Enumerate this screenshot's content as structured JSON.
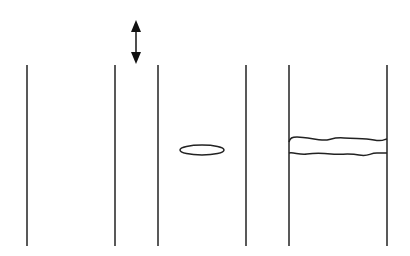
{
  "diagram": {
    "stroke_color": "#222222",
    "background": "#ffffff",
    "lines": [
      {
        "id": "line-1",
        "x": 27,
        "y1": 65,
        "y2": 246
      },
      {
        "id": "line-2",
        "x": 115,
        "y1": 65,
        "y2": 246
      },
      {
        "id": "line-3",
        "x": 158,
        "y1": 65,
        "y2": 246
      },
      {
        "id": "line-4",
        "x": 246,
        "y1": 65,
        "y2": 246
      },
      {
        "id": "line-5",
        "x": 289,
        "y1": 65,
        "y2": 246
      },
      {
        "id": "line-6",
        "x": 387,
        "y1": 65,
        "y2": 246
      }
    ],
    "arrow": {
      "x": 136,
      "y1": 20,
      "y2": 64,
      "type": "double-headed"
    },
    "ellipse": {
      "cx": 202,
      "cy": 150,
      "rx": 22,
      "ry": 5
    },
    "wavy_band": {
      "x1": 289,
      "x2": 387,
      "top_y": 137,
      "bottom_y": 154
    }
  }
}
